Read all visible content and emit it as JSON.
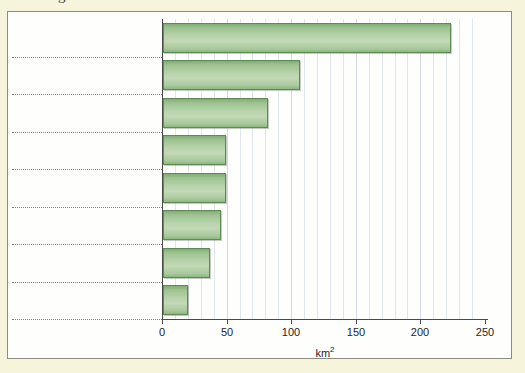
{
  "page": {
    "background_color": "#f7f4dc",
    "cropped_caption_glyph": "g"
  },
  "figure": {
    "frame_background": "#fefefd",
    "frame_border_color": "#8c8c80"
  },
  "chart_data": {
    "type": "bar",
    "orientation": "horizontal",
    "title": "",
    "subtitle": "",
    "xlabel": "km²",
    "ylabel": "",
    "categories": [
      "",
      "",
      "",
      "",
      "",
      "",
      "",
      ""
    ],
    "values": [
      223,
      106,
      81,
      49,
      49,
      45,
      36,
      19
    ],
    "xlim": [
      0,
      250
    ],
    "xticks": [
      0,
      50,
      100,
      150,
      200,
      250
    ],
    "xtick_labels": [
      "0",
      "50",
      "100",
      "150",
      "200",
      "250"
    ],
    "minor_gridline_step": 10,
    "grid": "vertical-minor-and-major",
    "legend": "none",
    "bar_fill_top": "#7fae74",
    "bar_fill_mid": "#c2d9b6",
    "bar_fill_bottom": "#8bb87f",
    "bar_border_color": "#5e8a55",
    "row_separator_style": "dotted",
    "row_separator_color": "#6d6d74",
    "annotations": []
  }
}
